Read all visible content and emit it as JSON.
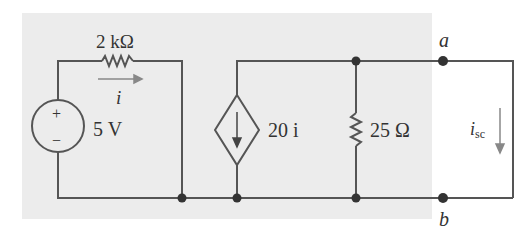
{
  "diagram": {
    "type": "circuit",
    "source": {
      "label": "5 V",
      "plus": "+",
      "minus": "−"
    },
    "resistor_1": {
      "label": "2 kΩ"
    },
    "current_i": {
      "label": "i"
    },
    "dependent_source": {
      "label": "20 i"
    },
    "resistor_2": {
      "label": "25 Ω"
    },
    "terminal_a": {
      "label": "a"
    },
    "terminal_b": {
      "label": "b"
    },
    "short_current": {
      "label": "i",
      "subscript": "sc"
    },
    "colors": {
      "wire": "#555555",
      "shade": "#ececec",
      "arrow": "#888888"
    }
  }
}
